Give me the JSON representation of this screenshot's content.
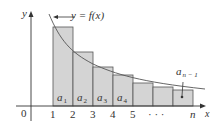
{
  "figure": {
    "axes": {
      "x_label": "x",
      "y_label": "y",
      "origin_label": "0"
    },
    "curve_label": "y = f(x)",
    "x_ticks": [
      {
        "label": "1",
        "x": 53
      },
      {
        "label": "2",
        "x": 73
      },
      {
        "label": "3",
        "x": 93
      },
      {
        "label": "4",
        "x": 113
      },
      {
        "label": "5",
        "x": 133
      },
      {
        "label": "· · ·",
        "x": 156
      },
      {
        "label": "n",
        "x": 193
      }
    ],
    "rectangles": [
      {
        "label_base": "a",
        "label_sub": "1",
        "x0": 53,
        "x1": 73,
        "top": 27
      },
      {
        "label_base": "a",
        "label_sub": "2",
        "x0": 73,
        "x1": 93,
        "top": 52
      },
      {
        "label_base": "a",
        "label_sub": "3",
        "x0": 93,
        "x1": 113,
        "top": 67
      },
      {
        "label_base": "a",
        "label_sub": "4",
        "x0": 113,
        "x1": 133,
        "top": 75
      },
      {
        "label_base": "",
        "label_sub": "",
        "x0": 133,
        "x1": 153,
        "top": 83
      },
      {
        "label_base": "",
        "label_sub": "",
        "x0": 153,
        "x1": 173,
        "top": 87
      },
      {
        "label_base": "",
        "label_sub": "",
        "x0": 173,
        "x1": 193,
        "top": 90
      }
    ],
    "last_term_label": {
      "base": "a",
      "sub": "n − 1"
    },
    "colors": {
      "rect_fill": "#d4d4d4",
      "rect_stroke": "#555555",
      "curve": "#555555",
      "axis": "#333333",
      "text": "#333333"
    }
  }
}
